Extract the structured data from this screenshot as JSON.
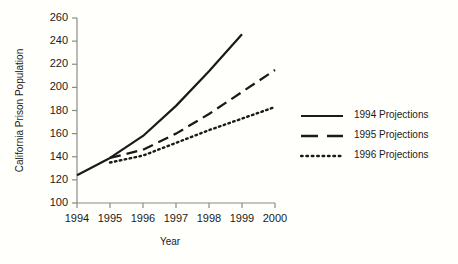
{
  "chart_data": {
    "type": "line",
    "title": "",
    "xlabel": "Year",
    "ylabel": "California Prison Population",
    "x": [
      1994,
      1995,
      1996,
      1997,
      1998,
      1999,
      2000
    ],
    "xlim": [
      1994,
      2000
    ],
    "ylim": [
      100,
      260
    ],
    "yticks": [
      100,
      120,
      140,
      160,
      180,
      200,
      220,
      240,
      260
    ],
    "xticks": [
      "1994",
      "1995",
      "1996",
      "1997",
      "1998",
      "1999",
      "2000"
    ],
    "ytick_labels": [
      "100",
      "120",
      "140",
      "160",
      "180",
      "200",
      "220",
      "240",
      "260"
    ],
    "grid": false,
    "legend_position": "right",
    "series": [
      {
        "name": "1994 Projections",
        "style": "solid",
        "color": "#1a1a1a",
        "x": [
          1994,
          1995,
          1996,
          1997,
          1998,
          1999
        ],
        "values": [
          124,
          139,
          158,
          184,
          214,
          246
        ]
      },
      {
        "name": "1995 Projections",
        "style": "dashed",
        "color": "#1a1a1a",
        "x": [
          1995,
          1996,
          1997,
          1998,
          1999,
          2000
        ],
        "values": [
          139,
          146,
          160,
          177,
          196,
          215
        ]
      },
      {
        "name": "1996 Projections",
        "style": "dotted",
        "color": "#1a1a1a",
        "x": [
          1995,
          1996,
          1997,
          1998,
          1999,
          2000
        ],
        "values": [
          135,
          141,
          152,
          163,
          173,
          183
        ]
      }
    ]
  },
  "legend": {
    "entries": [
      {
        "label": "1994 Projections",
        "swatch": "solid-line-swatch"
      },
      {
        "label": "1995 Projections",
        "swatch": "dashed-line-swatch"
      },
      {
        "label": "1996 Projections",
        "swatch": "dotted-line-swatch"
      }
    ]
  },
  "axes": {
    "x_title": "Year",
    "y_title": "California Prison Population"
  },
  "colors": {
    "background": "#fffffc",
    "ink": "#1a1a1a",
    "axis": "#8a8a85"
  }
}
